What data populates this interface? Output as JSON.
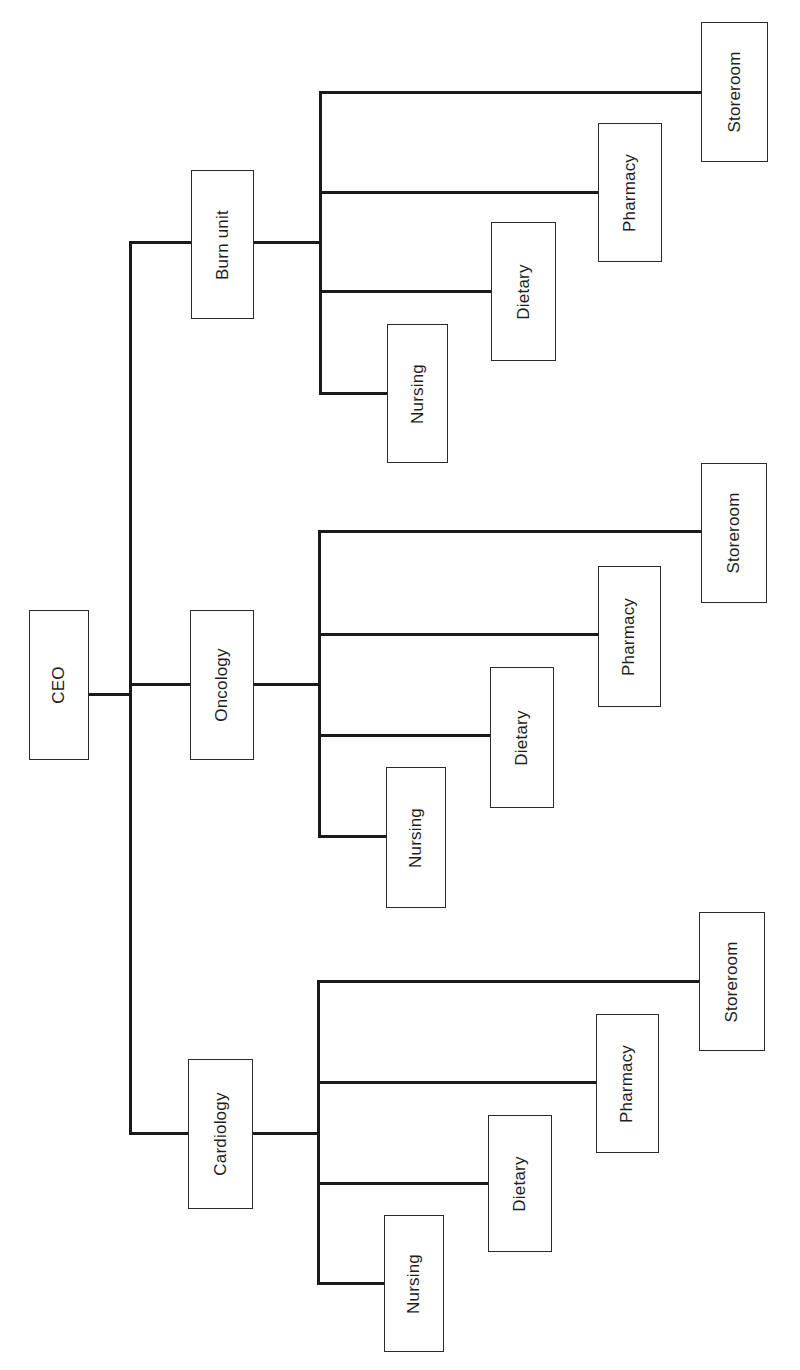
{
  "diagram": {
    "type": "org-chart",
    "orientation": "rotated-90-ccw",
    "colors": {
      "line": "#1a1a1a",
      "box_border": "#2a2a2a",
      "text": "#1e1e1e",
      "background": "#ffffff"
    },
    "root": {
      "label": "CEO",
      "box": {
        "x": 29,
        "y": 610,
        "w": 60,
        "h": 150
      }
    },
    "trunk": {
      "x": 130,
      "y_top": 242,
      "y_bottom": 1133
    },
    "departments": [
      {
        "label": "Burn unit",
        "box": {
          "x": 191,
          "y": 170,
          "w": 63,
          "h": 149
        },
        "connector_y": 242,
        "subtrunk": {
          "x": 320,
          "y_top": 92,
          "y_bottom": 393
        },
        "units": [
          {
            "label": "Storeroom",
            "box": {
              "x": 701,
              "y": 22,
              "w": 67,
              "h": 140
            },
            "connector_y": 92
          },
          {
            "label": "Pharmacy",
            "box": {
              "x": 598,
              "y": 123,
              "w": 64,
              "h": 139
            },
            "connector_y": 192
          },
          {
            "label": "Dietary",
            "box": {
              "x": 491,
              "y": 222,
              "w": 65,
              "h": 139
            },
            "connector_y": 291
          },
          {
            "label": "Nursing",
            "box": {
              "x": 387,
              "y": 324,
              "w": 61,
              "h": 139
            },
            "connector_y": 393
          }
        ]
      },
      {
        "label": "Oncology",
        "box": {
          "x": 190,
          "y": 610,
          "w": 64,
          "h": 150
        },
        "connector_y": 684,
        "subtrunk": {
          "x": 319,
          "y_top": 531,
          "y_bottom": 836
        },
        "units": [
          {
            "label": "Storeroom",
            "box": {
              "x": 701,
              "y": 463,
              "w": 66,
              "h": 140
            },
            "connector_y": 531
          },
          {
            "label": "Pharmacy",
            "box": {
              "x": 598,
              "y": 566,
              "w": 63,
              "h": 141
            },
            "connector_y": 634
          },
          {
            "label": "Dietary",
            "box": {
              "x": 490,
              "y": 667,
              "w": 64,
              "h": 141
            },
            "connector_y": 735
          },
          {
            "label": "Nursing",
            "box": {
              "x": 386,
              "y": 767,
              "w": 60,
              "h": 141
            },
            "connector_y": 836
          }
        ]
      },
      {
        "label": "Cardiology",
        "box": {
          "x": 188,
          "y": 1059,
          "w": 65,
          "h": 150
        },
        "connector_y": 1133,
        "subtrunk": {
          "x": 318,
          "y_top": 981,
          "y_bottom": 1283
        },
        "units": [
          {
            "label": "Storeroom",
            "box": {
              "x": 699,
              "y": 912,
              "w": 66,
              "h": 139
            },
            "connector_y": 981
          },
          {
            "label": "Pharmacy",
            "box": {
              "x": 596,
              "y": 1014,
              "w": 63,
              "h": 139
            },
            "connector_y": 1082
          },
          {
            "label": "Dietary",
            "box": {
              "x": 488,
              "y": 1115,
              "w": 64,
              "h": 137
            },
            "connector_y": 1183
          },
          {
            "label": "Nursing",
            "box": {
              "x": 384,
              "y": 1215,
              "w": 60,
              "h": 137
            },
            "connector_y": 1283
          }
        ]
      }
    ]
  }
}
